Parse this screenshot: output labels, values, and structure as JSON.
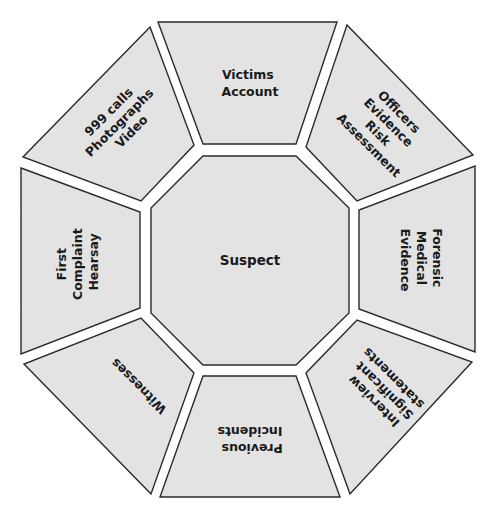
{
  "diagram": {
    "type": "octagon-ring",
    "colors": {
      "fill": "#e3e3e3",
      "stroke": "#2a2a2a",
      "text": "#1a1a1a",
      "background": "#ffffff"
    },
    "center": {
      "label": "Suspect"
    },
    "segments": [
      {
        "position": "top",
        "lines": [
          "Victims",
          "Account"
        ]
      },
      {
        "position": "top-right",
        "lines": [
          "Officers",
          "Evidence",
          "Risk",
          "Assessment"
        ]
      },
      {
        "position": "right",
        "lines": [
          "Forensic",
          "Medical",
          "Evidence"
        ]
      },
      {
        "position": "bottom-right",
        "lines": [
          "Interview",
          "Significant",
          "statements"
        ]
      },
      {
        "position": "bottom",
        "lines": [
          "Previous",
          "Incidents"
        ]
      },
      {
        "position": "bottom-left",
        "lines": [
          "Witnesses"
        ]
      },
      {
        "position": "left",
        "lines": [
          "First",
          "Complaint",
          "Hearsay"
        ]
      },
      {
        "position": "top-left",
        "lines": [
          "999 calls",
          "Photographs",
          "Video"
        ]
      }
    ]
  }
}
